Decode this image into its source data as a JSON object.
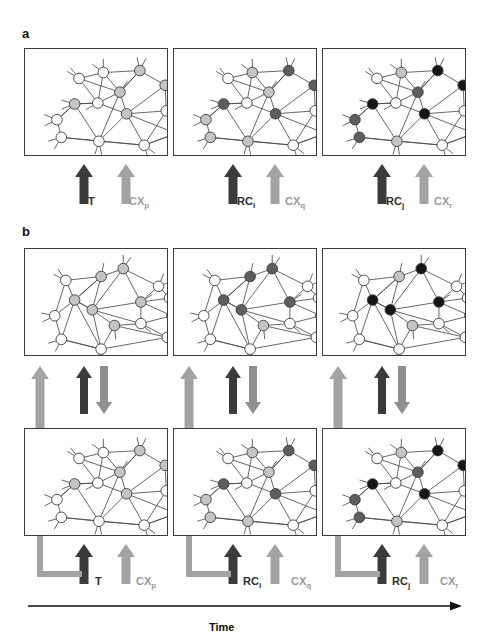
{
  "figure": {
    "panels": [
      {
        "letter": "a"
      },
      {
        "letter": "b"
      }
    ],
    "time_axis": {
      "label": "Time"
    },
    "colors": {
      "node_white": "#ffffff",
      "node_light_gray": "#c4c4c4",
      "node_dark_gray": "#5e5e5e",
      "node_black": "#161616",
      "node_stroke": "#3a3a3a",
      "edge": "#4a4a4a",
      "box_border": "#3c3c3c",
      "arrow_dark": "#3b3b3b",
      "arrow_light": "#a3a3a3",
      "arrow_mid_gray": "#8f8f8f",
      "time_axis": "#111111"
    },
    "stimulus_arrows": [
      {
        "dark_label": "T",
        "dark_sub": "",
        "light_label": "CX",
        "light_sub": "p"
      },
      {
        "dark_label": "RC",
        "dark_sub": "i",
        "light_label": "CX",
        "light_sub": "q"
      },
      {
        "dark_label": "RC",
        "dark_sub": "j",
        "light_label": "CX",
        "light_sub": "r"
      }
    ],
    "panel_a": {
      "boxes": [
        {
          "index": 0,
          "node_shades": [
            "white",
            "white",
            "light",
            "light",
            "light",
            "white",
            "light",
            "white",
            "light",
            "white",
            "white",
            "white",
            "white",
            "white"
          ]
        },
        {
          "index": 1,
          "node_shades": [
            "white",
            "light",
            "dark",
            "dark",
            "light",
            "white",
            "dark",
            "light",
            "dark",
            "white",
            "light",
            "light",
            "white",
            "white"
          ]
        },
        {
          "index": 2,
          "node_shades": [
            "white",
            "light",
            "black",
            "black",
            "dark",
            "white",
            "black",
            "dark",
            "black",
            "white",
            "dark",
            "light",
            "white",
            "black"
          ]
        }
      ]
    },
    "panel_b": {
      "upper_boxes": [
        {
          "index": 0,
          "node_shades": [
            "white",
            "light",
            "light",
            "light",
            "white",
            "light",
            "light",
            "light",
            "white",
            "white",
            "white",
            "white",
            "white",
            "white",
            "white"
          ]
        },
        {
          "index": 1,
          "node_shades": [
            "white",
            "dark",
            "dark",
            "dark",
            "white",
            "dark",
            "dark",
            "light",
            "white",
            "white",
            "white",
            "white",
            "white",
            "white",
            "white"
          ]
        },
        {
          "index": 2,
          "node_shades": [
            "white",
            "light",
            "black",
            "black",
            "white",
            "black",
            "black",
            "light",
            "white",
            "white",
            "white",
            "white",
            "white",
            "white",
            "white"
          ]
        }
      ],
      "lower_boxes": [
        {
          "index": 0,
          "node_shades": [
            "white",
            "white",
            "light",
            "light",
            "light",
            "white",
            "light",
            "white",
            "light",
            "white",
            "white",
            "white",
            "white",
            "white"
          ]
        },
        {
          "index": 1,
          "node_shades": [
            "white",
            "light",
            "dark",
            "dark",
            "light",
            "white",
            "dark",
            "light",
            "dark",
            "white",
            "light",
            "light",
            "white",
            "white"
          ]
        },
        {
          "index": 2,
          "node_shades": [
            "white",
            "light",
            "black",
            "black",
            "dark",
            "white",
            "black",
            "dark",
            "black",
            "white",
            "dark",
            "light",
            "white",
            "black"
          ]
        }
      ],
      "interaction_arrows": [
        {
          "feedback_up": "light",
          "pair_up": "dark",
          "pair_down": "gray"
        },
        {
          "feedback_up": "light",
          "pair_up": "dark",
          "pair_down": "gray"
        },
        {
          "feedback_up": "light",
          "pair_up": "dark",
          "pair_down": "gray"
        }
      ]
    }
  }
}
